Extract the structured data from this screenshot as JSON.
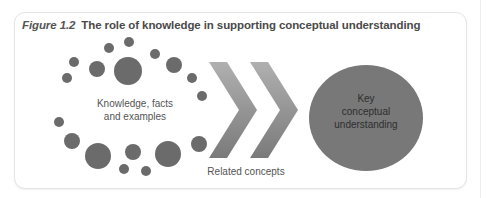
{
  "figure": {
    "number_label": "Figure 1.2",
    "title": "The role of knowledge in supporting conceptual understanding"
  },
  "diagram": {
    "knowledge_cluster": {
      "label_line1": "Knowledge, facts",
      "label_line2": "and examples",
      "dot_color": "#6b6b6b",
      "dots": [
        {
          "cx": 67,
          "cy": 78,
          "r": 5
        },
        {
          "cx": 74,
          "cy": 62,
          "r": 5
        },
        {
          "cx": 97,
          "cy": 69,
          "r": 8
        },
        {
          "cx": 109,
          "cy": 48,
          "r": 5
        },
        {
          "cx": 129,
          "cy": 42,
          "r": 5
        },
        {
          "cx": 128,
          "cy": 71,
          "r": 14
        },
        {
          "cx": 155,
          "cy": 54,
          "r": 5
        },
        {
          "cx": 174,
          "cy": 65,
          "r": 8
        },
        {
          "cx": 192,
          "cy": 78,
          "r": 5
        },
        {
          "cx": 202,
          "cy": 96,
          "r": 5
        },
        {
          "cx": 59,
          "cy": 122,
          "r": 5
        },
        {
          "cx": 72,
          "cy": 141,
          "r": 8
        },
        {
          "cx": 98,
          "cy": 156,
          "r": 13
        },
        {
          "cx": 124,
          "cy": 169,
          "r": 5
        },
        {
          "cx": 133,
          "cy": 152,
          "r": 8
        },
        {
          "cx": 146,
          "cy": 171,
          "r": 5
        },
        {
          "cx": 168,
          "cy": 154,
          "r": 13
        },
        {
          "cx": 199,
          "cy": 144,
          "r": 8
        }
      ]
    },
    "arrows": {
      "label": "Related concepts",
      "count": 2,
      "gradient_top": "#b0b0b0",
      "gradient_bottom": "#7a7a7a"
    },
    "target": {
      "line1": "Key",
      "line2": "conceptual",
      "line3": "understanding",
      "fill": "#787878",
      "text_color": "#2e2e2e"
    },
    "label_color": "#555555"
  }
}
